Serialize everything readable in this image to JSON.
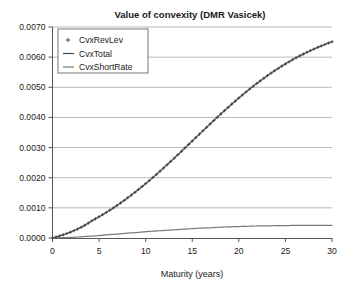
{
  "chart_data": {
    "type": "line",
    "title": "Value of convexity (DMR Vasicek)",
    "xlabel": "Maturity (years)",
    "ylabel": "",
    "xlim": [
      0,
      30
    ],
    "ylim": [
      0,
      0.007
    ],
    "grid": true,
    "legend_position": "top-left",
    "xticks": [
      0,
      5,
      10,
      15,
      20,
      25,
      30
    ],
    "xtick_labels": [
      "0",
      "5",
      "10",
      "15",
      "20",
      "25",
      "30"
    ],
    "yticks": [
      0.0,
      0.001,
      0.002,
      0.003,
      0.004,
      0.005,
      0.006,
      0.007
    ],
    "ytick_labels": [
      "0.0000",
      "0.0010",
      "0.0020",
      "0.0030",
      "0.0040",
      "0.0050",
      "0.0060",
      "0.0070"
    ],
    "x": [
      0,
      1,
      2,
      3,
      4,
      5,
      6,
      7,
      8,
      9,
      10,
      11,
      12,
      13,
      14,
      15,
      16,
      17,
      18,
      19,
      20,
      21,
      22,
      23,
      24,
      25,
      26,
      27,
      28,
      29,
      30
    ],
    "series": [
      {
        "name": "CvxRevLev",
        "style": "markers",
        "marker": "+",
        "color": "#3a3a3a",
        "values": [
          0.0,
          1e-05,
          3e-05,
          8e-05,
          0.00016,
          0.00028,
          0.00045,
          0.00066,
          0.00092,
          0.00122,
          0.00156,
          0.00194,
          0.00235,
          0.00279,
          0.00325,
          0.00373,
          0.00421,
          0.00469,
          0.00505,
          0.00512,
          0.00421,
          0.00455,
          0.00487,
          0.00518,
          0.00547,
          0.00573,
          0.00597,
          0.00618,
          0.00635,
          0.00647,
          0.00653
        ]
      },
      {
        "name": "CvxTotal",
        "style": "line",
        "color": "#4a4a4a",
        "values": [
          0.0,
          1e-05,
          3e-05,
          8e-05,
          0.00016,
          0.00028,
          0.00045,
          0.00066,
          0.00092,
          0.00122,
          0.00156,
          0.00194,
          0.00235,
          0.00279,
          0.00325,
          0.00373,
          0.00421,
          0.00469,
          0.00516,
          0.00561,
          0.00604,
          0.00645,
          0.00683,
          0.00718,
          0.0075,
          0.00553,
          0.00578,
          0.00601,
          0.00621,
          0.00638,
          0.00651
        ]
      },
      {
        "name": "CvxShortRate",
        "style": "line",
        "color": "#7a7a7a",
        "values": [
          0.0,
          1e-05,
          2e-05,
          4e-05,
          6e-05,
          8e-05,
          0.00011,
          0.00013,
          0.00016,
          0.00018,
          0.00021,
          0.00023,
          0.00025,
          0.00027,
          0.00029,
          0.00031,
          0.00033,
          0.00034,
          0.00036,
          0.00037,
          0.00038,
          0.00039,
          0.0004,
          0.0004,
          0.00041,
          0.00041,
          0.00042,
          0.00042,
          0.00042,
          0.00042,
          0.00042
        ]
      }
    ],
    "legend": [
      {
        "label": "CvxRevLev",
        "marker": "+",
        "color": "#3a3a3a"
      },
      {
        "label": "CvxTotal",
        "marker": "line",
        "color": "#4a4a4a"
      },
      {
        "label": "CvxShortRate",
        "marker": "line",
        "color": "#7a7a7a"
      }
    ]
  }
}
